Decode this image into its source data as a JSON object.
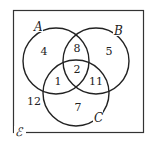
{
  "diagram": {
    "type": "venn-3",
    "universal_symbol": "ℰ",
    "sets": [
      {
        "name": "A"
      },
      {
        "name": "B"
      },
      {
        "name": "C"
      }
    ],
    "regions": {
      "A_only": "4",
      "B_only": "5",
      "C_only": "7",
      "A_and_B_only": "8",
      "A_and_C_only": "1",
      "B_and_C_only": "11",
      "A_and_B_and_C": "2",
      "outside": "12"
    },
    "colors": {
      "stroke": "#222222",
      "background": "#ffffff"
    }
  }
}
